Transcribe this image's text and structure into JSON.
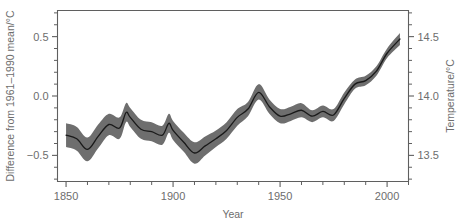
{
  "chart_data": {
    "type": "line",
    "title": "",
    "subtitle": "",
    "xlabel": "Year",
    "ylabel": "Difference from 1961–1990 mean/°C",
    "ylabel_right": "Temperature/°C",
    "xlim": [
      1846,
      2010
    ],
    "ylim": [
      -0.72,
      0.72
    ],
    "ylim_right": [
      13.28,
      14.72
    ],
    "grid": false,
    "legend": false,
    "legend_position": "none",
    "xticks": [
      1850,
      1900,
      1950,
      2000
    ],
    "xticklabels": [
      "1850",
      "1900",
      "1950",
      "2000"
    ],
    "xminor_step": 10,
    "yticks": [
      -0.5,
      0.0,
      0.5
    ],
    "yticklabels": [
      "−0.5",
      "0.0",
      "0.5"
    ],
    "yminor_step": 0.1,
    "yticks_right": [
      13.5,
      14.0,
      14.5
    ],
    "yticklabels_right": [
      "13.5",
      "14.0",
      "14.5"
    ],
    "yminor_step_right": 0.1,
    "right_axis_offset": 14.0,
    "colors": {
      "line": "#1a1a1a",
      "band": "#6e6e6e",
      "axis": "#5f5f5f",
      "text": "#6d6d6d",
      "background": "#ffffff"
    },
    "series": [
      {
        "name": "Global mean temperature anomaly (smoothed)",
        "x": [
          1850,
          1855,
          1860,
          1865,
          1870,
          1875,
          1878,
          1880,
          1885,
          1890,
          1895,
          1898,
          1900,
          1905,
          1910,
          1915,
          1920,
          1925,
          1930,
          1935,
          1940,
          1945,
          1950,
          1955,
          1960,
          1965,
          1970,
          1975,
          1980,
          1985,
          1990,
          1995,
          2000,
          2006
        ],
        "values": [
          -0.33,
          -0.36,
          -0.45,
          -0.34,
          -0.24,
          -0.27,
          -0.14,
          -0.18,
          -0.28,
          -0.3,
          -0.33,
          -0.23,
          -0.29,
          -0.39,
          -0.48,
          -0.42,
          -0.36,
          -0.29,
          -0.18,
          -0.11,
          0.03,
          -0.09,
          -0.17,
          -0.15,
          -0.12,
          -0.17,
          -0.13,
          -0.16,
          -0.02,
          0.1,
          0.13,
          0.21,
          0.36,
          0.48
        ]
      },
      {
        "name": "Uncertainty band lower (approx. 95%)",
        "x": [
          1850,
          1855,
          1860,
          1865,
          1870,
          1875,
          1878,
          1880,
          1885,
          1890,
          1895,
          1898,
          1900,
          1905,
          1910,
          1915,
          1920,
          1925,
          1930,
          1935,
          1940,
          1945,
          1950,
          1955,
          1960,
          1965,
          1970,
          1975,
          1980,
          1985,
          1990,
          1995,
          2000,
          2006
        ],
        "values": [
          -0.43,
          -0.46,
          -0.55,
          -0.44,
          -0.33,
          -0.36,
          -0.22,
          -0.26,
          -0.36,
          -0.38,
          -0.41,
          -0.31,
          -0.37,
          -0.47,
          -0.57,
          -0.5,
          -0.43,
          -0.36,
          -0.25,
          -0.17,
          -0.03,
          -0.15,
          -0.23,
          -0.21,
          -0.18,
          -0.22,
          -0.18,
          -0.21,
          -0.07,
          0.06,
          0.09,
          0.17,
          0.32,
          0.43
        ]
      },
      {
        "name": "Uncertainty band upper (approx. 95%)",
        "x": [
          1850,
          1855,
          1860,
          1865,
          1870,
          1875,
          1878,
          1880,
          1885,
          1890,
          1895,
          1898,
          1900,
          1905,
          1910,
          1915,
          1920,
          1925,
          1930,
          1935,
          1940,
          1945,
          1950,
          1955,
          1960,
          1965,
          1970,
          1975,
          1980,
          1985,
          1990,
          1995,
          2000,
          2006
        ],
        "values": [
          -0.23,
          -0.26,
          -0.35,
          -0.24,
          -0.15,
          -0.18,
          -0.06,
          -0.1,
          -0.2,
          -0.22,
          -0.25,
          -0.15,
          -0.21,
          -0.31,
          -0.39,
          -0.34,
          -0.29,
          -0.22,
          -0.11,
          -0.05,
          0.1,
          -0.03,
          -0.11,
          -0.09,
          -0.06,
          -0.12,
          -0.08,
          -0.11,
          0.03,
          0.14,
          0.17,
          0.25,
          0.4,
          0.53
        ]
      }
    ],
    "annotations": []
  },
  "axes": {
    "x_title": "Year",
    "y_left_title": "Difference from 1961–1990 mean/°C",
    "y_right_title": "Temperature/°C"
  }
}
